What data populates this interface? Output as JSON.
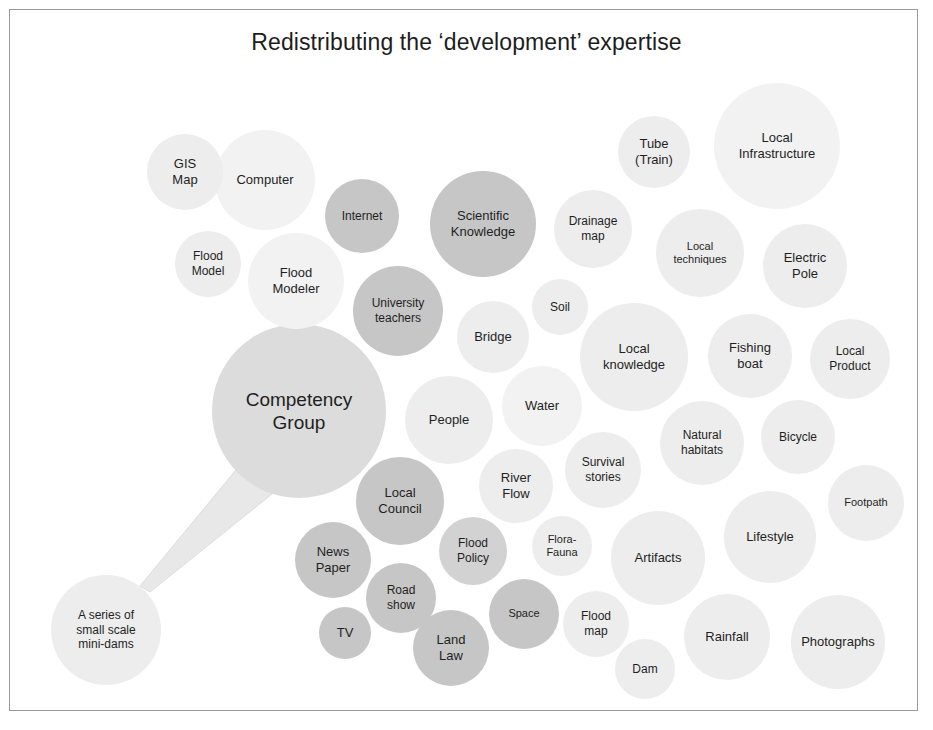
{
  "page": {
    "title": "Redistributing the ‘development’ expertise",
    "background": "#ffffff",
    "frame_color": "#9a9a9a",
    "text_color": "#1f1f1f"
  },
  "palette": {
    "lightest": "#f2f2f2",
    "light": "#ededed",
    "light_mid": "#e6e6e6",
    "mid": "#dcdcdc",
    "mid_dark": "#d2d2d2",
    "dark": "#c6c6c6",
    "darker": "#bcbcbc",
    "connector": "#e0e0e0"
  },
  "chart_data": {
    "type": "bubble",
    "title": "Redistributing the ‘development’ expertise",
    "xlabel": "",
    "ylabel": "",
    "legend": "none",
    "grid": false,
    "note": "Bubble / cluster diagram. Each bubble is a named expertise item; bubble radius encodes relative prominence and fill shade encodes grouping. A connector line links the central 'Competency Group' bubble to the 'A series of small scale mini-dams' bubble.",
    "connections": [
      {
        "from": "Competency Group",
        "to": "A series of small scale mini-dams"
      }
    ],
    "bubbles": [
      {
        "label": "GIS\nMap",
        "cx": 185,
        "cy": 172,
        "r": 38,
        "fill": "#ededed",
        "font": 13
      },
      {
        "label": "Computer",
        "cx": 265,
        "cy": 180,
        "r": 50,
        "fill": "#f2f2f2",
        "font": 13
      },
      {
        "label": "Flood\nModel",
        "cx": 208,
        "cy": 264,
        "r": 33,
        "fill": "#ededed",
        "font": 12
      },
      {
        "label": "Flood\nModeler",
        "cx": 296,
        "cy": 281,
        "r": 48,
        "fill": "#f2f2f2",
        "font": 13
      },
      {
        "label": "Internet",
        "cx": 362,
        "cy": 216,
        "r": 37,
        "fill": "#c6c6c6",
        "font": 12
      },
      {
        "label": "Scientific\nKnowledge",
        "cx": 483,
        "cy": 224,
        "r": 53,
        "fill": "#c6c6c6",
        "font": 13
      },
      {
        "label": "University\nteachers",
        "cx": 398,
        "cy": 311,
        "r": 45,
        "fill": "#c6c6c6",
        "font": 12
      },
      {
        "label": "Drainage\nmap",
        "cx": 593,
        "cy": 229,
        "r": 39,
        "fill": "#ededed",
        "font": 12
      },
      {
        "label": "Tube\n(Train)",
        "cx": 654,
        "cy": 152,
        "r": 36,
        "fill": "#ededed",
        "font": 13
      },
      {
        "label": "Local\nInfrastructure",
        "cx": 777,
        "cy": 146,
        "r": 63,
        "fill": "#f2f2f2",
        "font": 13
      },
      {
        "label": "Local\ntechniques",
        "cx": 700,
        "cy": 253,
        "r": 44,
        "fill": "#ededed",
        "font": 11
      },
      {
        "label": "Electric\nPole",
        "cx": 805,
        "cy": 266,
        "r": 42,
        "fill": "#ededed",
        "font": 13
      },
      {
        "label": "Soil",
        "cx": 560,
        "cy": 307,
        "r": 28,
        "fill": "#ededed",
        "font": 12
      },
      {
        "label": "Bridge",
        "cx": 493,
        "cy": 337,
        "r": 36,
        "fill": "#ededed",
        "font": 13
      },
      {
        "label": "Local\nknowledge",
        "cx": 634,
        "cy": 357,
        "r": 54,
        "fill": "#ededed",
        "font": 13
      },
      {
        "label": "Fishing\nboat",
        "cx": 750,
        "cy": 356,
        "r": 42,
        "fill": "#ededed",
        "font": 13
      },
      {
        "label": "Local\nProduct",
        "cx": 850,
        "cy": 359,
        "r": 40,
        "fill": "#ededed",
        "font": 12
      },
      {
        "label": "Competency\nGroup",
        "cx": 299,
        "cy": 411,
        "r": 87,
        "fill": "#dcdcdc",
        "font": 19
      },
      {
        "label": "People",
        "cx": 449,
        "cy": 420,
        "r": 44,
        "fill": "#ededed",
        "font": 13
      },
      {
        "label": "Water",
        "cx": 542,
        "cy": 406,
        "r": 40,
        "fill": "#f2f2f2",
        "font": 13
      },
      {
        "label": "Natural\nhabitats",
        "cx": 702,
        "cy": 443,
        "r": 42,
        "fill": "#ededed",
        "font": 12
      },
      {
        "label": "Bicycle",
        "cx": 798,
        "cy": 437,
        "r": 37,
        "fill": "#ededed",
        "font": 12
      },
      {
        "label": "Survival\nstories",
        "cx": 603,
        "cy": 470,
        "r": 38,
        "fill": "#ededed",
        "font": 12
      },
      {
        "label": "River\nFlow",
        "cx": 516,
        "cy": 486,
        "r": 37,
        "fill": "#ededed",
        "font": 13
      },
      {
        "label": "Local\nCouncil",
        "cx": 400,
        "cy": 501,
        "r": 44,
        "fill": "#c6c6c6",
        "font": 13
      },
      {
        "label": "Footpath",
        "cx": 866,
        "cy": 503,
        "r": 38,
        "fill": "#ededed",
        "font": 11
      },
      {
        "label": "Lifestyle",
        "cx": 770,
        "cy": 537,
        "r": 46,
        "fill": "#ededed",
        "font": 13
      },
      {
        "label": "Flood\nPolicy",
        "cx": 473,
        "cy": 551,
        "r": 34,
        "fill": "#d2d2d2",
        "font": 12
      },
      {
        "label": "Flora-\nFauna",
        "cx": 562,
        "cy": 546,
        "r": 30,
        "fill": "#ededed",
        "font": 11
      },
      {
        "label": "Artifacts",
        "cx": 658,
        "cy": 558,
        "r": 47,
        "fill": "#ededed",
        "font": 13
      },
      {
        "label": "News\nPaper",
        "cx": 333,
        "cy": 560,
        "r": 38,
        "fill": "#c6c6c6",
        "font": 13
      },
      {
        "label": "Road\nshow",
        "cx": 401,
        "cy": 598,
        "r": 35,
        "fill": "#c6c6c6",
        "font": 12
      },
      {
        "label": "Space",
        "cx": 524,
        "cy": 614,
        "r": 35,
        "fill": "#c6c6c6",
        "font": 11
      },
      {
        "label": "Flood\nmap",
        "cx": 596,
        "cy": 624,
        "r": 33,
        "fill": "#ededed",
        "font": 12
      },
      {
        "label": "TV",
        "cx": 345,
        "cy": 633,
        "r": 26,
        "fill": "#c6c6c6",
        "font": 13
      },
      {
        "label": "Land\nLaw",
        "cx": 451,
        "cy": 648,
        "r": 38,
        "fill": "#c6c6c6",
        "font": 13
      },
      {
        "label": "Rainfall",
        "cx": 727,
        "cy": 637,
        "r": 43,
        "fill": "#ededed",
        "font": 13
      },
      {
        "label": "Photographs",
        "cx": 838,
        "cy": 642,
        "r": 47,
        "fill": "#ededed",
        "font": 13
      },
      {
        "label": "Dam",
        "cx": 645,
        "cy": 669,
        "r": 30,
        "fill": "#ededed",
        "font": 12
      },
      {
        "label": "A series of\nsmall scale\nmini-dams",
        "cx": 106,
        "cy": 630,
        "r": 55,
        "fill": "#ededed",
        "font": 12
      }
    ]
  }
}
